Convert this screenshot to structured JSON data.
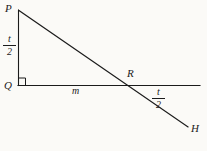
{
  "figure": {
    "type": "geometry-diagram",
    "background_color": "#fbfaf7",
    "line_color": "#1b1b1b",
    "points": [
      {
        "name": "P",
        "label": "P",
        "x": 18,
        "y": 10
      },
      {
        "name": "Q",
        "label": "Q",
        "x": 18,
        "y": 85
      },
      {
        "name": "R",
        "label": "R",
        "x": 127,
        "y": 85
      },
      {
        "name": "H",
        "label": "H",
        "x": 188,
        "y": 128
      }
    ],
    "segments": [
      {
        "name": "vertical-leg-PQ",
        "from": "P",
        "to": "Q"
      },
      {
        "name": "horizontal-line",
        "from": "Q",
        "to": "right-edge"
      },
      {
        "name": "diagonal-ray-PH",
        "from": "P",
        "to": "H"
      }
    ],
    "right_angle_at": "Q",
    "labels": {
      "point_p": "P",
      "point_q": "Q",
      "point_r": "R",
      "point_h": "H",
      "base_length": "m",
      "height_numerator": "t",
      "height_denominator": "2",
      "angle_numerator": "t",
      "angle_denominator": "2"
    }
  }
}
